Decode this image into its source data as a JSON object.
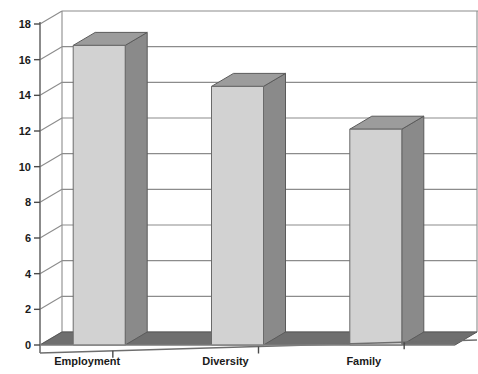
{
  "chart_data": {
    "type": "bar",
    "title": "",
    "subtitle": "",
    "xlabel": "",
    "ylabel": "",
    "categories": [
      "Employment",
      "Diversity",
      "Family"
    ],
    "values": [
      16.8,
      14.5,
      12.1
    ],
    "ylim": [
      0,
      18
    ],
    "ytick_step": 2,
    "yticks": [
      0,
      2,
      4,
      6,
      8,
      10,
      12,
      14,
      16,
      18
    ],
    "ytick_labels": [
      "0",
      "2",
      "4",
      "6",
      "8",
      "10",
      "12",
      "14",
      "16",
      "18"
    ],
    "grid": true,
    "grid_axis": "y",
    "legend": false,
    "legend_position": "none",
    "style": "3d",
    "annotations": [],
    "series": [
      {
        "name": "",
        "values": [
          16.8,
          14.5,
          12.1
        ]
      }
    ]
  },
  "colors": {
    "background": "#ffffff",
    "bar_front": "#d2d2d2",
    "bar_side": "#8a8a8a",
    "bar_top": "#9c9c9c",
    "floor": "#6f6f6f",
    "grid": "#8c8c8c",
    "axis": "#6e6e6e",
    "text": "#1a1a1a"
  }
}
